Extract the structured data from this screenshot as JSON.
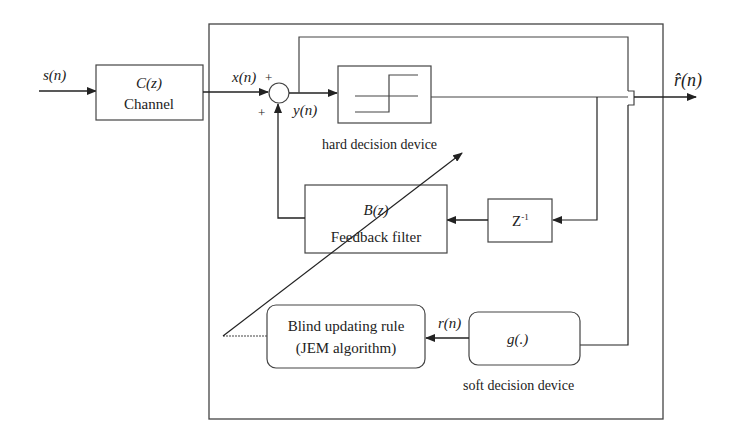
{
  "diagram": {
    "type": "block-diagram",
    "signals": {
      "input": "s(n)",
      "channel_output": "x(n)",
      "equalizer_output": "y(n)",
      "soft_output": "r(n)",
      "decision_output": "r̂(n)"
    },
    "blocks": {
      "channel": {
        "line1": "C(z)",
        "line2": "Channel"
      },
      "hard_decision": {
        "label": "hard decision device"
      },
      "feedback_filter": {
        "line1": "B(z)",
        "line2": "Feedback filter"
      },
      "delay": {
        "base": "Z",
        "sup": "-1"
      },
      "blind_update": {
        "line1": "Blind updating rule",
        "line2": "(JEM algorithm)"
      },
      "soft_decision": {
        "inner": "g(.)",
        "label": "soft decision device"
      }
    },
    "summer": {
      "plus_top": "+",
      "plus_bottom": "+"
    },
    "colors": {
      "line": "#333333",
      "background": "#ffffff"
    }
  }
}
